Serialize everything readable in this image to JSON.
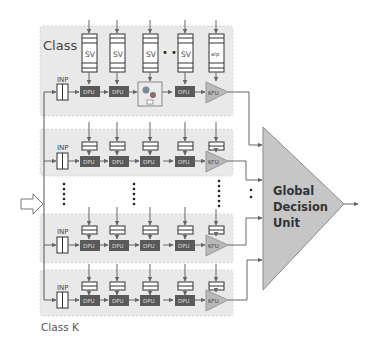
{
  "diagram": {
    "type": "block-diagram",
    "classes": [
      {
        "label": "Class 0",
        "input_label": "INP",
        "queues": [
          "SV",
          "SV",
          "SV",
          "SV",
          "alp"
        ],
        "processing_units": [
          "DPU",
          "DPU",
          "image-block",
          "DPU"
        ],
        "ellipsis": "• •",
        "final_unit": "KFU"
      },
      {
        "label": "",
        "input_label": "INP",
        "processing_units": [
          "DPU",
          "DPU",
          "DPU",
          "DPU"
        ],
        "final_unit": "KFU"
      },
      {
        "label": "",
        "input_label": "INP",
        "processing_units": [
          "DPU",
          "DPU",
          "DPU",
          "DPU"
        ],
        "final_unit": "KFU"
      },
      {
        "label": "Class K",
        "input_label": "INP",
        "processing_units": [
          "DPU",
          "DPU",
          "DPU",
          "DPU"
        ],
        "final_unit": "KFU"
      }
    ],
    "global_unit": {
      "line1": "Global",
      "line2": "Decision",
      "line3": "Unit"
    },
    "colors": {
      "class_box": "#e8e8e8",
      "dpu_fill": "#5a5a5a",
      "dpu_text": "#e0e0e0",
      "kfu_fill": "#b8b8b8",
      "gdu_fill": "#c4c4c4",
      "line": "#555555"
    }
  },
  "labels": {
    "class0": "Class 0",
    "classK": "Class K",
    "inp": "INP",
    "sv": "SV",
    "alp": "alp",
    "dpu": "DPU",
    "kfu": "KFU",
    "gdu1": "Global",
    "gdu2": "Decision",
    "gdu3": "Unit"
  }
}
